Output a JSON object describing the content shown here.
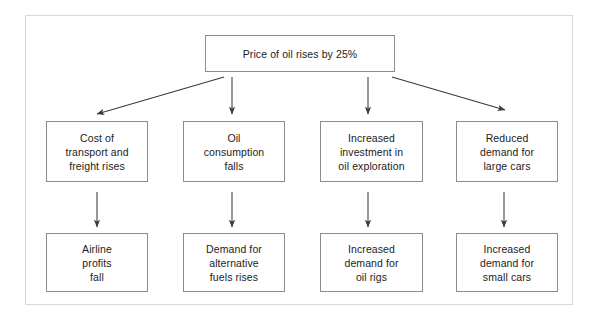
{
  "diagram": {
    "title_node": {
      "id": "price-of-oil",
      "text": "Price of oil rises by 25%",
      "x": 205,
      "y": 35,
      "w": 190,
      "h": 37
    },
    "effects_row": [
      {
        "id": "cost-of-transport",
        "text": "Cost of\ntransport and\nfreight rises",
        "x": 46,
        "y": 121,
        "w": 102,
        "h": 61
      },
      {
        "id": "oil-consumption",
        "text": "Oil\nconsumption\nfalls",
        "x": 183,
        "y": 121,
        "w": 102,
        "h": 61
      },
      {
        "id": "increased-investment",
        "text": "Increased\ninvestment in\noil exploration",
        "x": 320,
        "y": 121,
        "w": 103,
        "h": 61
      },
      {
        "id": "reduced-demand-large-cars",
        "text": "Reduced\ndemand for\nlarge cars",
        "x": 456,
        "y": 121,
        "w": 102,
        "h": 61
      }
    ],
    "outcomes_row": [
      {
        "id": "airline-profits",
        "text": "Airline\nprofits\nfall",
        "x": 46,
        "y": 233,
        "w": 102,
        "h": 59
      },
      {
        "id": "demand-alternative-fuels",
        "text": "Demand for\nalternative\nfuels rises",
        "x": 183,
        "y": 233,
        "w": 102,
        "h": 59
      },
      {
        "id": "demand-oil-rigs",
        "text": "Increased\ndemand for\noil rigs",
        "x": 320,
        "y": 233,
        "w": 103,
        "h": 59
      },
      {
        "id": "demand-small-cars",
        "text": "Increased\ndemand for\nsmall cars",
        "x": 456,
        "y": 233,
        "w": 102,
        "h": 59
      }
    ],
    "connectors": [
      {
        "id": "arrow-to-cost-of-transport",
        "x1": 224,
        "y1": 77,
        "x2": 97,
        "y2": 114
      },
      {
        "id": "arrow-to-oil-consumption",
        "x1": 232,
        "y1": 77,
        "x2": 232,
        "y2": 114
      },
      {
        "id": "arrow-to-increased-investment",
        "x1": 368,
        "y1": 77,
        "x2": 368,
        "y2": 114
      },
      {
        "id": "arrow-to-reduced-demand-large-cars",
        "x1": 392,
        "y1": 77,
        "x2": 505,
        "y2": 110
      },
      {
        "id": "arrow-to-airline-profits",
        "x1": 97,
        "y1": 192,
        "x2": 97,
        "y2": 227
      },
      {
        "id": "arrow-to-demand-alternative-fuels",
        "x1": 232,
        "y1": 192,
        "x2": 232,
        "y2": 227
      },
      {
        "id": "arrow-to-demand-oil-rigs",
        "x1": 368,
        "y1": 192,
        "x2": 368,
        "y2": 227
      },
      {
        "id": "arrow-to-demand-small-cars",
        "x1": 504,
        "y1": 192,
        "x2": 504,
        "y2": 227
      }
    ],
    "colors": {
      "frame_border": "#d8d8d8",
      "node_border": "#8c8c8c",
      "arrow": "#3a3a3a",
      "text": "#222222",
      "background": "#ffffff"
    }
  }
}
